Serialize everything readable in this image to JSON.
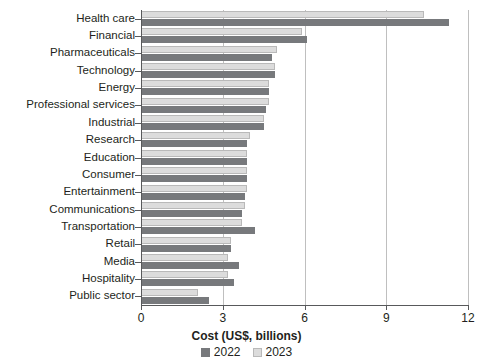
{
  "chart_data": {
    "type": "bar",
    "orientation": "horizontal",
    "title": "",
    "xlabel": "Cost (US$, billions)",
    "ylabel": "",
    "xlim": [
      0,
      12
    ],
    "xticks": [
      0,
      3,
      6,
      9,
      12
    ],
    "xtick_labels": [
      "0",
      "3",
      "6",
      "9",
      "12"
    ],
    "grid": true,
    "grid_axis": "x",
    "legend_position": "bottom",
    "categories": [
      "Health care",
      "Financial",
      "Pharmaceuticals",
      "Technology",
      "Energy",
      "Professional services",
      "Industrial",
      "Research",
      "Education",
      "Consumer",
      "Entertainment",
      "Communications",
      "Transportation",
      "Retail",
      "Media",
      "Hospitality",
      "Public sector"
    ],
    "series": [
      {
        "name": "2022",
        "color": "#77797c",
        "values": [
          11.3,
          6.1,
          4.8,
          4.9,
          4.7,
          4.6,
          4.5,
          3.9,
          3.9,
          3.9,
          3.8,
          3.7,
          4.2,
          3.3,
          3.6,
          3.4,
          2.5
        ]
      },
      {
        "name": "2023",
        "color": "#dcdcdc",
        "values": [
          10.4,
          5.9,
          5.0,
          4.9,
          4.7,
          4.7,
          4.5,
          4.0,
          3.9,
          3.9,
          3.9,
          3.8,
          3.7,
          3.3,
          3.2,
          3.2,
          2.1
        ]
      }
    ]
  },
  "legend": {
    "items": [
      {
        "label": "2022",
        "swatch": "dark-gray-swatch"
      },
      {
        "label": "2023",
        "swatch": "light-gray-swatch"
      }
    ]
  }
}
